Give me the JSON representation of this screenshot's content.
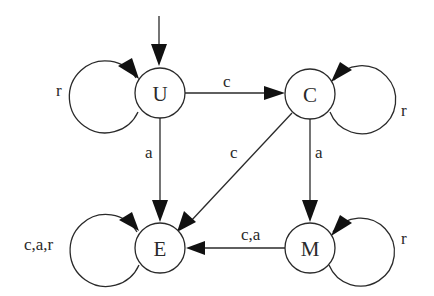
{
  "diagram": {
    "type": "state-machine",
    "background": "#ffffff",
    "stroke_color": "#2a2a2a",
    "nodes": [
      {
        "id": "U",
        "label": "U",
        "cx": 160,
        "cy": 93,
        "initial": true
      },
      {
        "id": "C",
        "label": "C",
        "cx": 310,
        "cy": 94
      },
      {
        "id": "E",
        "label": "E",
        "cx": 160,
        "cy": 248
      },
      {
        "id": "M",
        "label": "M",
        "cx": 310,
        "cy": 248
      }
    ],
    "edges": [
      {
        "from": "U",
        "to": "U",
        "label": "r"
      },
      {
        "from": "U",
        "to": "C",
        "label": "c"
      },
      {
        "from": "U",
        "to": "E",
        "label": "a"
      },
      {
        "from": "C",
        "to": "C",
        "label": "r"
      },
      {
        "from": "C",
        "to": "E",
        "label": "c"
      },
      {
        "from": "C",
        "to": "M",
        "label": "a"
      },
      {
        "from": "E",
        "to": "E",
        "label": "c,a,r"
      },
      {
        "from": "M",
        "to": "E",
        "label": "c,a"
      },
      {
        "from": "M",
        "to": "M",
        "label": "r"
      }
    ],
    "labels": {
      "node_U": "U",
      "node_C": "C",
      "node_E": "E",
      "node_M": "M",
      "loop_U": "r",
      "edge_U_C": "c",
      "edge_U_E": "a",
      "loop_C": "r",
      "edge_C_E": "c",
      "edge_C_M": "a",
      "loop_E": "c,a,r",
      "edge_M_E": "c,a",
      "loop_M": "r"
    }
  }
}
